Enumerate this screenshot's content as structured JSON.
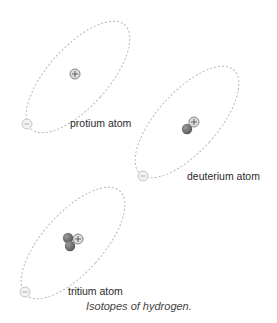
{
  "figure": {
    "caption": "Isotopes of hydrogen.",
    "atoms": [
      {
        "name": "protium",
        "label": "protium atom",
        "protons": 1,
        "neutrons": 0,
        "electrons": 1
      },
      {
        "name": "deuterium",
        "label": "deuterium atom",
        "protons": 1,
        "neutrons": 1,
        "electrons": 1
      },
      {
        "name": "tritium",
        "label": "tritium atom",
        "protons": 1,
        "neutrons": 2,
        "electrons": 1
      }
    ],
    "symbols": {
      "proton": "+",
      "electron": "−"
    },
    "colors": {
      "orbit": "#b8b8b8",
      "proton_fill": "#dcdcdc",
      "proton_stroke": "#7a7a7a",
      "neutron_fill": "#6e6e6e",
      "electron_fill": "#f2f2f2",
      "electron_stroke": "#c0c0c0"
    }
  }
}
